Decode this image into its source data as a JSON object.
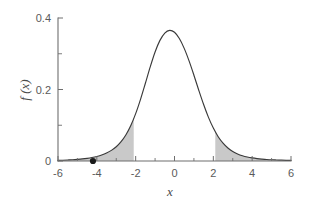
{
  "chart_data": {
    "type": "line",
    "title": "",
    "subtitle": "",
    "xlabel": "x",
    "ylabel": "f (x)",
    "xlim": [
      -6,
      6
    ],
    "ylim": [
      0,
      0.4
    ],
    "grid": false,
    "legend": null,
    "x_ticks": [
      -6,
      -4,
      -2,
      0,
      2,
      4,
      6
    ],
    "x_tick_labels": [
      "-6",
      "-4",
      "-2",
      "0",
      "2",
      "4",
      "6"
    ],
    "x_minor_ticks": [
      -5,
      -3,
      -1,
      1,
      3,
      5
    ],
    "y_ticks": [
      0,
      0.2,
      0.4
    ],
    "y_tick_labels": [
      "0",
      "0.2",
      "0.4"
    ],
    "y_minor_ticks": [
      0.1,
      0.3
    ],
    "curve": {
      "name": "density",
      "description": "bell-shaped probability density, peak 0.35 at x = 0",
      "peak_x": 0,
      "peak_y": 0.35,
      "color": "#3a3a3a",
      "x": [
        -6.0,
        -5.75,
        -5.5,
        -5.25,
        -5.0,
        -4.75,
        -4.5,
        -4.25,
        -4.0,
        -3.75,
        -3.5,
        -3.25,
        -3.0,
        -2.75,
        -2.5,
        -2.25,
        -2.0,
        -1.75,
        -1.5,
        -1.25,
        -1.0,
        -0.75,
        -0.5,
        -0.25,
        0.0,
        0.25,
        0.5,
        0.75,
        1.0,
        1.25,
        1.5,
        1.75,
        2.0,
        2.25,
        2.5,
        2.75,
        3.0,
        3.25,
        3.5,
        3.75,
        4.0,
        4.25,
        4.5,
        4.75,
        5.0,
        5.25,
        5.5,
        5.75,
        6.0
      ],
      "y": [
        0.0018,
        0.0022,
        0.0028,
        0.0035,
        0.0045,
        0.0058,
        0.0075,
        0.0097,
        0.0127,
        0.0167,
        0.0222,
        0.0297,
        0.04,
        0.0542,
        0.0735,
        0.0993,
        0.1324,
        0.1725,
        0.2175,
        0.2634,
        0.305,
        0.3374,
        0.3579,
        0.3655,
        0.36,
        0.3425,
        0.315,
        0.28,
        0.24,
        0.198,
        0.158,
        0.122,
        0.092,
        0.068,
        0.05,
        0.0365,
        0.0268,
        0.0198,
        0.0148,
        0.0112,
        0.0086,
        0.0067,
        0.0053,
        0.0042,
        0.0034,
        0.0028,
        0.0023,
        0.0019,
        0.0016
      ]
    },
    "shaded_regions": [
      {
        "name": "left-tail",
        "from": -6,
        "to": -2.1,
        "color": "#c9c9c9",
        "label": ""
      },
      {
        "name": "right-tail",
        "from": 2.1,
        "to": 6,
        "color": "#c9c9c9",
        "label": ""
      }
    ],
    "point_markers": [
      {
        "name": "observed-value",
        "x": -4.2,
        "y": 0,
        "color": "#1a1a1a",
        "label": ""
      }
    ],
    "annotations": []
  },
  "axes": {
    "x_axis_title": "x",
    "y_axis_title": "f (x)"
  },
  "colors": {
    "axis": "#6e6e6e",
    "curve": "#3a3a3a",
    "shade": "#c9c9c9",
    "marker": "#1a1a1a",
    "tick_text": "#5a5a5a",
    "background": "#ffffff"
  }
}
